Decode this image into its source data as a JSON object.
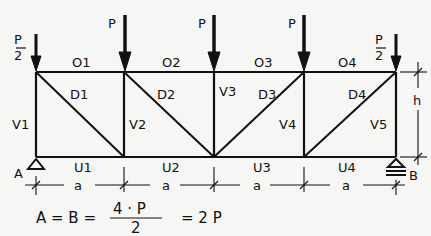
{
  "diagram": {
    "type": "truss",
    "top_chord_labels": [
      "O1",
      "O2",
      "O3",
      "O4"
    ],
    "bottom_chord_labels": [
      "U1",
      "U2",
      "U3",
      "U4"
    ],
    "vertical_labels": [
      "V1",
      "V2",
      "V3",
      "V4",
      "V5"
    ],
    "diagonal_labels": [
      "D1",
      "D2",
      "D3",
      "D4"
    ],
    "loads": {
      "end_numerator": "P",
      "end_denominator": "2",
      "middle": "P"
    },
    "supports": {
      "left": "A",
      "right": "B"
    },
    "dimensions": {
      "bay": "a",
      "height": "h"
    },
    "equation": {
      "lhs": "A = B =",
      "numerator": "4 · P",
      "denominator": "2",
      "rhs": "= 2 P"
    }
  }
}
